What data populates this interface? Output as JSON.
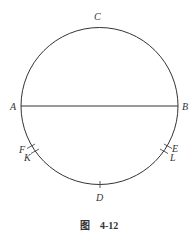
{
  "figure": {
    "caption_prefix": "图",
    "caption_number": "4-12",
    "circle": {
      "cx": 99.5,
      "cy": 106,
      "r": 78.5,
      "stroke": "#333333"
    },
    "diameter": {
      "from": "A",
      "to": "B"
    },
    "points": {
      "A": {
        "label": "A"
      },
      "B": {
        "label": "B"
      },
      "C": {
        "label": "C"
      },
      "D": {
        "label": "D"
      },
      "E": {
        "label": "E"
      },
      "F": {
        "label": "F"
      },
      "K": {
        "label": "K"
      },
      "L": {
        "label": "L"
      }
    }
  }
}
